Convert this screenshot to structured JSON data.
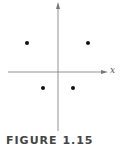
{
  "figure": {
    "caption": "FIGURE 1.15",
    "x_axis_label": "x",
    "axis_color": "#777777",
    "point_color": "#111111",
    "points": [
      {
        "quadrant": "II",
        "cx": 27,
        "cy": 43
      },
      {
        "quadrant": "I",
        "cx": 88,
        "cy": 43
      },
      {
        "quadrant": "III",
        "cx": 43,
        "cy": 88
      },
      {
        "quadrant": "IV",
        "cx": 73,
        "cy": 88
      }
    ]
  }
}
